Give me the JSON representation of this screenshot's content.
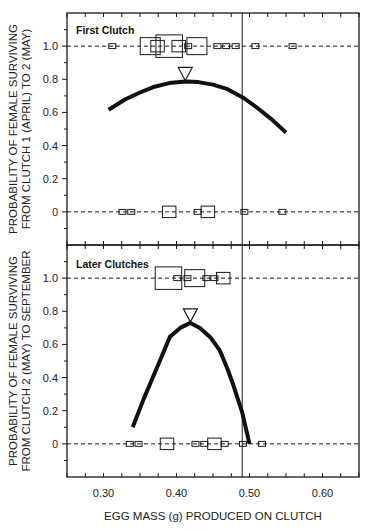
{
  "chart_data": [
    {
      "type": "scatter",
      "panel": "top",
      "title": "First Clutch",
      "xlabel": "EGG MASS (g) PRODUCED ON CLUTCH",
      "ylabel": [
        "PROBABILITY OF FEMALE SURVIVING",
        "FROM CLUTCH 1 (APRIL) TO 2 (MAY)"
      ],
      "xlim": [
        0.25,
        0.65
      ],
      "ylim": [
        -0.2,
        1.2
      ],
      "yticks": [
        0,
        0.2,
        0.4,
        0.6,
        0.8,
        1.0
      ],
      "ytick_labels": [
        "0",
        "0.2",
        "0.4",
        "0.6",
        "0.8",
        "1.0"
      ],
      "reference_lines": {
        "horizontal_dashed": [
          0,
          1.0
        ],
        "vertical": 0.49
      },
      "points_survived": [
        {
          "x": 0.312,
          "y": 1,
          "size": 1
        },
        {
          "x": 0.364,
          "y": 1,
          "size": 3
        },
        {
          "x": 0.374,
          "y": 1,
          "size": 2
        },
        {
          "x": 0.39,
          "y": 1,
          "size": 4
        },
        {
          "x": 0.403,
          "y": 1,
          "size": 2
        },
        {
          "x": 0.416,
          "y": 1,
          "size": 1
        },
        {
          "x": 0.428,
          "y": 1,
          "size": 3
        },
        {
          "x": 0.456,
          "y": 1,
          "size": 1
        },
        {
          "x": 0.468,
          "y": 1,
          "size": 1
        },
        {
          "x": 0.481,
          "y": 1,
          "size": 1
        },
        {
          "x": 0.508,
          "y": 1,
          "size": 1
        },
        {
          "x": 0.559,
          "y": 1,
          "size": 1
        }
      ],
      "points_died": [
        {
          "x": 0.326,
          "y": 0,
          "size": 1
        },
        {
          "x": 0.338,
          "y": 0,
          "size": 1
        },
        {
          "x": 0.39,
          "y": 0,
          "size": 2
        },
        {
          "x": 0.429,
          "y": 0,
          "size": 1
        },
        {
          "x": 0.443,
          "y": 0,
          "size": 2
        },
        {
          "x": 0.493,
          "y": 0,
          "size": 1
        },
        {
          "x": 0.545,
          "y": 0,
          "size": 1
        }
      ],
      "fitted_curve": {
        "x": [
          0.307,
          0.33,
          0.35,
          0.37,
          0.39,
          0.412,
          0.43,
          0.45,
          0.47,
          0.492,
          0.51,
          0.53,
          0.55
        ],
        "y": [
          0.616,
          0.68,
          0.72,
          0.755,
          0.777,
          0.787,
          0.783,
          0.768,
          0.74,
          0.687,
          0.63,
          0.56,
          0.479
        ]
      },
      "optimum_marker": {
        "x": 0.412,
        "y": 0.787,
        "shape": "inverted-triangle"
      }
    },
    {
      "type": "scatter",
      "panel": "bottom",
      "title": "Later Clutches",
      "xlabel": "EGG MASS (g) PRODUCED ON CLUTCH",
      "ylabel": [
        "PROBABILITY OF FEMALE SURVIVING",
        "FROM CLUTCH 2 (MAY) TO SEPTEMBER"
      ],
      "xlim": [
        0.25,
        0.65
      ],
      "ylim": [
        -0.2,
        1.2
      ],
      "xticks": [
        0.3,
        0.4,
        0.5,
        0.6
      ],
      "xtick_labels": [
        "0.30",
        "0.40",
        "0.50",
        "0.60"
      ],
      "yticks": [
        0,
        0.2,
        0.4,
        0.6,
        0.8,
        1.0
      ],
      "ytick_labels": [
        "0",
        "0.2",
        "0.4",
        "0.6",
        "0.8",
        "1.0"
      ],
      "reference_lines": {
        "horizontal_dashed": [
          0,
          1.0
        ],
        "vertical": 0.49
      },
      "points_survived": [
        {
          "x": 0.389,
          "y": 1,
          "size": 4
        },
        {
          "x": 0.401,
          "y": 1,
          "size": 1
        },
        {
          "x": 0.415,
          "y": 1,
          "size": 1
        },
        {
          "x": 0.425,
          "y": 1,
          "size": 3
        },
        {
          "x": 0.441,
          "y": 1,
          "size": 1
        },
        {
          "x": 0.452,
          "y": 1,
          "size": 1
        },
        {
          "x": 0.464,
          "y": 1,
          "size": 2
        }
      ],
      "points_died": [
        {
          "x": 0.336,
          "y": 0,
          "size": 1
        },
        {
          "x": 0.348,
          "y": 0,
          "size": 1
        },
        {
          "x": 0.387,
          "y": 0,
          "size": 2
        },
        {
          "x": 0.426,
          "y": 0,
          "size": 1
        },
        {
          "x": 0.438,
          "y": 0,
          "size": 1
        },
        {
          "x": 0.452,
          "y": 0,
          "size": 2
        },
        {
          "x": 0.466,
          "y": 0,
          "size": 1
        },
        {
          "x": 0.491,
          "y": 0,
          "size": 1
        },
        {
          "x": 0.517,
          "y": 0,
          "size": 1
        }
      ],
      "fitted_curve": {
        "x": [
          0.34,
          0.355,
          0.368,
          0.38,
          0.391,
          0.405,
          0.419,
          0.432,
          0.447,
          0.459,
          0.47,
          0.477,
          0.49,
          0.5
        ],
        "y": [
          0.1,
          0.27,
          0.405,
          0.53,
          0.646,
          0.7,
          0.73,
          0.7,
          0.64,
          0.566,
          0.45,
          0.366,
          0.19,
          0.0
        ]
      },
      "optimum_marker": {
        "x": 0.419,
        "y": 0.73,
        "shape": "inverted-triangle"
      }
    }
  ],
  "figure": {
    "panels": [
      {
        "title": "First Clutch",
        "ylabel_line1": "PROBABILITY OF FEMALE SURVIVING",
        "ylabel_line2": "FROM CLUTCH 1 (APRIL) TO 2 (MAY)"
      },
      {
        "title": "Later Clutches",
        "ylabel_line1": "PROBABILITY OF FEMALE SURVIVING",
        "ylabel_line2": "FROM CLUTCH 2 (MAY) TO SEPTEMBER"
      }
    ],
    "xlabel": "EGG MASS (g) PRODUCED ON CLUTCH",
    "colors": {
      "ink": "#1a1a1a",
      "background": "#ffffff",
      "curve": "#111111"
    }
  }
}
